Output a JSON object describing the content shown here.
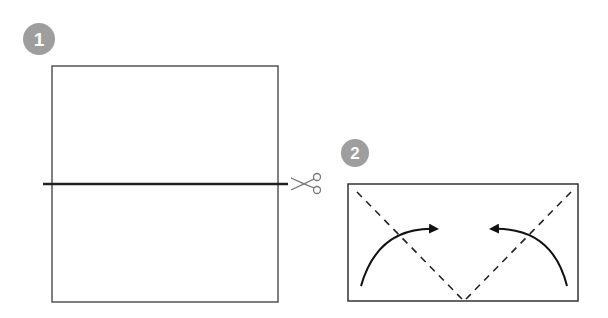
{
  "steps": [
    {
      "number": "1",
      "badge_color": "#9e9e9e",
      "description": "Square sheet with horizontal cut line through the middle"
    },
    {
      "number": "2",
      "badge_color": "#9e9e9e",
      "description": "Rectangle with two diagonal dashed fold lines meeting at bottom center; curved arrows show folding corners inward"
    }
  ],
  "colors": {
    "outline": "#555555",
    "cut_line": "#222222",
    "fold_line": "#222222",
    "arrow": "#111111",
    "scissors": "#777777"
  },
  "icons": {
    "scissors": "scissors-icon",
    "fold_arrow": "curved-arrow-icon"
  }
}
